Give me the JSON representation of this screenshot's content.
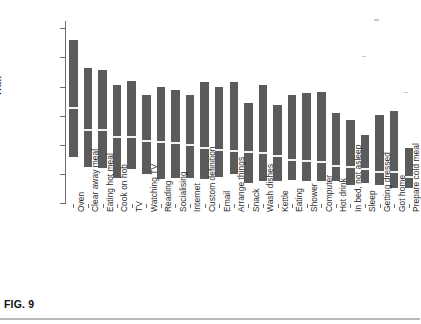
{
  "figure": {
    "caption": "FIG. 9"
  },
  "chart_data": {
    "type": "bar",
    "title": "",
    "subtitle": "",
    "xlabel": "",
    "ylabel": "Watt",
    "ylim": [
      0,
      1250
    ],
    "yticks": [
      0,
      200,
      400,
      600,
      800,
      1000,
      1200
    ],
    "ytick_labels": [
      "0",
      "200",
      "400",
      "600",
      "800",
      "1000",
      "1200"
    ],
    "grid": false,
    "legend": "none",
    "note": "Floating (range) bars: each bar spans from a low value to a high value, with a light horizontal median marker inside.",
    "categories": [
      "Oven",
      "Clear away meal",
      "Eating hot meal",
      "Cook on hob",
      "TV",
      "Watching TV",
      "Reading",
      "Socialising",
      "Internet",
      "Custom definition",
      "Email",
      "Arrange things",
      "Snack",
      "Wash dishes",
      "Kettle",
      "Eating",
      "Shower",
      "Computer",
      "Hot drink",
      "In bed, not asleep",
      "Sleep",
      "Getting dressed",
      "Got home",
      "Prepare cold meal"
    ],
    "series": [
      {
        "name": "low",
        "values": [
          315,
          245,
          240,
          170,
          230,
          200,
          165,
          170,
          170,
          165,
          180,
          200,
          135,
          150,
          150,
          155,
          150,
          150,
          150,
          125,
          135,
          120,
          100,
          105
        ]
      },
      {
        "name": "median",
        "values": [
          650,
          500,
          500,
          455,
          450,
          425,
          415,
          415,
          395,
          375,
          365,
          355,
          350,
          340,
          320,
          295,
          285,
          280,
          255,
          245,
          230,
          215,
          215,
          180
        ]
      },
      {
        "name": "high",
        "values": [
          1120,
          930,
          915,
          810,
          840,
          740,
          795,
          775,
          740,
          830,
          795,
          830,
          690,
          810,
          675,
          745,
          755,
          760,
          620,
          570,
          470,
          605,
          630,
          375
        ]
      }
    ]
  }
}
